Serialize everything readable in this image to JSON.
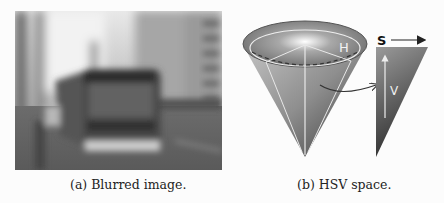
{
  "figure": {
    "subfigures": [
      {
        "id": "a",
        "caption": "(a) Blurred image.",
        "content": "blurred grayscale photo of a bus on a city street"
      },
      {
        "id": "b",
        "caption": "(b) HSV space.",
        "labels": {
          "hue": "H",
          "saturation": "S",
          "value": "V"
        }
      }
    ]
  }
}
